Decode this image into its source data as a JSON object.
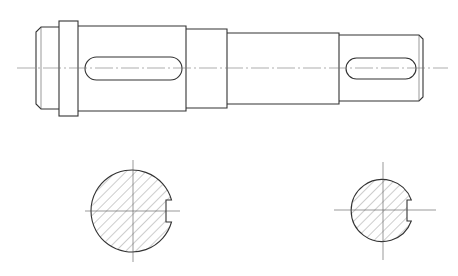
{
  "drawing": {
    "type": "technical-drawing",
    "subject": "stepped shaft with two keyways",
    "colors": {
      "line": "#333333",
      "background": "#ffffff",
      "centerline": "#777777"
    },
    "front_view": {
      "centerline_y": 68,
      "centerline_x": [
        17,
        448
      ],
      "sections": [
        {
          "name": "left-journal",
          "x": [
            36,
            59
          ],
          "y": [
            27,
            109
          ],
          "chamfer": 5
        },
        {
          "name": "collar",
          "x": [
            59,
            78
          ],
          "y": [
            21,
            116
          ]
        },
        {
          "name": "main-body",
          "x": [
            78,
            186
          ],
          "y": [
            26,
            111
          ]
        },
        {
          "name": "step",
          "x": [
            186,
            227
          ],
          "y": [
            29,
            108
          ]
        },
        {
          "name": "mid-journal",
          "x": [
            227,
            339
          ],
          "y": [
            33,
            104
          ]
        },
        {
          "name": "right-end",
          "x": [
            339,
            423
          ],
          "y": [
            35,
            101
          ],
          "chamfer": 4
        }
      ],
      "keyways": [
        {
          "name": "left-keyway",
          "x": [
            85,
            182
          ],
          "y": [
            57,
            80
          ]
        },
        {
          "name": "right-keyway",
          "x": [
            346,
            416
          ],
          "y": [
            58,
            79
          ]
        }
      ]
    },
    "section_views": [
      {
        "name": "section-large",
        "cx": 133,
        "cy": 211,
        "r": 41,
        "notch_y": [
          200,
          222
        ],
        "notch_depth": 7
      },
      {
        "name": "section-small",
        "cx": 383,
        "cy": 210,
        "r": 31,
        "notch_y": [
          200,
          221
        ],
        "notch_depth": 5
      }
    ]
  }
}
